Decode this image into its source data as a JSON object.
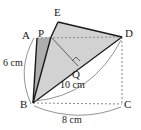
{
  "figure": {
    "type": "geometry-diagram",
    "background": "#ffffff",
    "colors": {
      "flap_fill": "#d2d2d2",
      "strip_fill": "#aeaeae",
      "stroke": "#1a1a1a",
      "dashed": "#8a8a8a",
      "arc": "#777777"
    },
    "points": [
      {
        "name": "A",
        "label": "A",
        "x": 37,
        "y": 38,
        "label_x": 22,
        "label_y": 30
      },
      {
        "name": "B",
        "label": "B",
        "x": 33,
        "y": 103,
        "label_x": 20,
        "label_y": 99
      },
      {
        "name": "C",
        "label": "C",
        "x": 122,
        "y": 104,
        "label_x": 124,
        "label_y": 99
      },
      {
        "name": "D",
        "label": "D",
        "x": 122,
        "y": 37,
        "label_x": 125,
        "label_y": 28
      },
      {
        "name": "E",
        "label": "E",
        "x": 58,
        "y": 22,
        "label_x": 54,
        "label_y": 7
      },
      {
        "name": "P",
        "label": "P",
        "x": 51,
        "y": 37,
        "label_x": 38,
        "label_y": 28
      },
      {
        "name": "Q",
        "label": "Q",
        "x": 78,
        "y": 66,
        "label_x": 72,
        "label_y": 69
      }
    ],
    "measurements": [
      {
        "name": "side-ab",
        "label": "6 cm",
        "x": 3,
        "y": 58
      },
      {
        "name": "diagonal-bd",
        "label": "10 cm",
        "x": 60,
        "y": 80
      },
      {
        "name": "side-bc",
        "label": "8 cm",
        "x": 62,
        "y": 115
      }
    ],
    "right_angle": {
      "name": "right-angle-q",
      "at": "Q",
      "size": 6
    }
  }
}
